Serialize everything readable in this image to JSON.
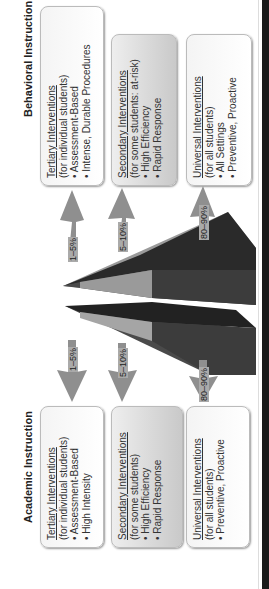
{
  "behavioral": {
    "title": "Behavioral Instruction",
    "tiers": [
      {
        "heading": "Tertiary Interventions",
        "sub": "(for individual students)",
        "bullets": [
          "• Assessment-Based",
          "• Intense, Durable Procedures"
        ],
        "pct": "1–5%"
      },
      {
        "heading": "Secondary Interventions",
        "sub": "(for some students: at-risk)",
        "bullets": [
          "• High Efficiency",
          "• Rapid Response"
        ],
        "pct": "5–10%"
      },
      {
        "heading": "Universal Interventions",
        "sub": "(for all students)",
        "bullets": [
          "• All Settings",
          "• Preventive, Proactive"
        ],
        "pct": "80–90%"
      }
    ]
  },
  "academic": {
    "title": "Academic Instruction",
    "tiers": [
      {
        "heading": "Tertiary Interventions",
        "sub": "(for individual students)",
        "bullets": [
          "• Assessment-Based",
          "• High Intensity"
        ],
        "pct": "1–5%"
      },
      {
        "heading": "Secondary Interventions",
        "sub": "(for some students)",
        "bullets": [
          "• High Efficiency",
          "• Rapid Response"
        ],
        "pct": "5–10%"
      },
      {
        "heading": "Universal Interventions",
        "sub": "(for all students)",
        "bullets": [
          "• Preventive, Proactive"
        ],
        "pct": "80–90%"
      }
    ]
  },
  "colors": {
    "tier_dark": "#2a2a2a",
    "tier_mid": "#555555",
    "tier_light": "#9a9a9a",
    "arrow": "#8f8f8f"
  }
}
